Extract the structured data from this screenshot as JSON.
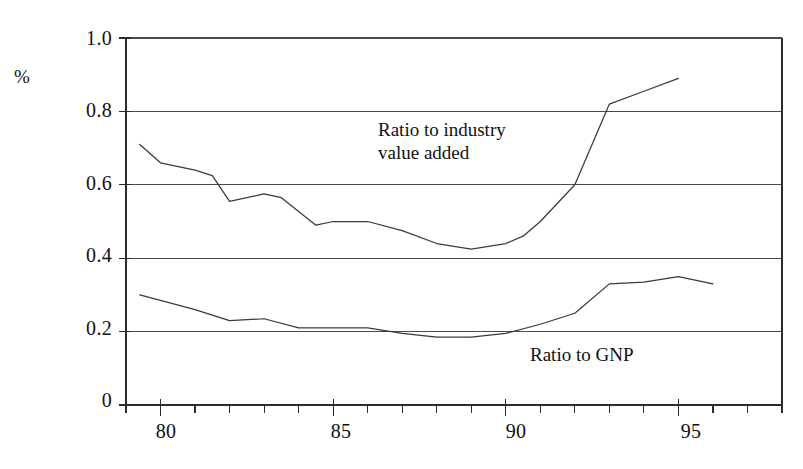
{
  "chart_data": {
    "type": "line",
    "title": "",
    "subtitle": "",
    "xlabel": "",
    "ylabel": "%",
    "xlim": [
      79.0,
      98.0
    ],
    "ylim": [
      0.0,
      1.0
    ],
    "grid": true,
    "grid_axis": "y",
    "legend_position": "inline-annotation",
    "y_ticks": [
      "0",
      "0.2",
      "0.4",
      "0.6",
      "0.8",
      "1.0"
    ],
    "y_tick_values": [
      0,
      0.2,
      0.4,
      0.6,
      0.8,
      1.0
    ],
    "x_ticks": [
      "80",
      "85",
      "90",
      "95"
    ],
    "x_tick_values": [
      80,
      85,
      90,
      95
    ],
    "x_minor_tick_values": [
      79,
      80,
      81,
      82,
      83,
      84,
      85,
      86,
      87,
      88,
      89,
      90,
      91,
      92,
      93,
      94,
      95,
      96,
      97,
      98
    ],
    "series": [
      {
        "name": "Ratio to industry value added",
        "annotation": "Ratio to industry\nvalue added",
        "color": "#3a3a3a",
        "x": [
          79.4,
          80.0,
          81.0,
          81.5,
          82.0,
          83.0,
          83.5,
          84.5,
          85.0,
          86.0,
          87.0,
          88.0,
          89.0,
          90.0,
          90.5,
          91.0,
          92.0,
          93.0,
          94.0,
          95.0
        ],
        "values": [
          0.71,
          0.66,
          0.64,
          0.625,
          0.555,
          0.575,
          0.565,
          0.49,
          0.5,
          0.5,
          0.475,
          0.44,
          0.425,
          0.44,
          0.46,
          0.5,
          0.6,
          0.82,
          0.855,
          0.89
        ]
      },
      {
        "name": "Ratio to GNP",
        "annotation": "Ratio to GNP",
        "color": "#3a3a3a",
        "x": [
          79.4,
          80.0,
          81.0,
          82.0,
          83.0,
          84.0,
          85.0,
          86.0,
          87.0,
          88.0,
          89.0,
          90.0,
          91.0,
          92.0,
          93.0,
          94.0,
          95.0,
          96.0
        ],
        "values": [
          0.3,
          0.285,
          0.26,
          0.23,
          0.235,
          0.21,
          0.21,
          0.21,
          0.195,
          0.185,
          0.185,
          0.195,
          0.22,
          0.25,
          0.33,
          0.335,
          0.35,
          0.33
        ]
      }
    ]
  },
  "annotations": {
    "upper_label_line1": "Ratio to industry",
    "upper_label_line2": "value added",
    "lower_label": "Ratio to GNP"
  },
  "axis": {
    "y_axis_title": "%"
  },
  "style": {
    "line_color": "#3a3a3a",
    "axis_color": "#2b2b2b",
    "grid_color": "#4a4a4a",
    "background": "#ffffff",
    "text_color": "#111111"
  }
}
